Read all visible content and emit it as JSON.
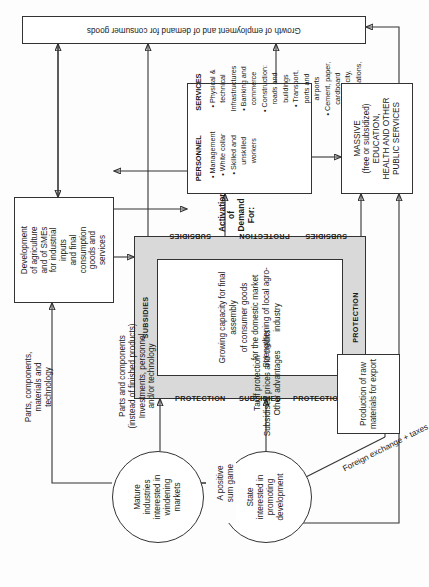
{
  "diagram": {
    "orientation": "page rotated 90 degrees counter-clockwise",
    "accent_shade": "#d9d9d9",
    "line_color": "#333333",
    "background": "#fdfdfd"
  },
  "nodes": {
    "mature_industries": "Mature\nindustries\ninterested in\nwindening\nmarkets",
    "state": "State\ninterested in\npromoting\ndevelopment",
    "development_agriculture": "Development\nof agriculture\nand of SMEs\nfor industrial\ninputs\nand final\nconsumption\ngoods and\nservices",
    "growing_capacity": "Growing capacity for final assembly\nof consumer goods\nfor the domestic market\nStrengthening of local agro-industry",
    "raw_materials": "Production of raw\nmaterials for export",
    "massive_education": "MASSIVE\n(free or subsidized)\nEDUCATION,\nHEALTH AND OTHER\nPUBLIC SERVICES",
    "growth_employment": "Growth of employment and of demand for consumer goods"
  },
  "demand_box": {
    "heading": "Activation of Demand For:",
    "personnel_header": "PERSONNEL",
    "personnel_items": [
      "Management",
      "White collar",
      "Skilled and",
      "unskilled workers"
    ],
    "services_header": "SERVICES",
    "services_items": [
      "Physical & technical Infrastructures",
      "Banking and commerce",
      "Construction: roads and buildings",
      "Transport, ports and airports",
      "Cement, paper, cardboard",
      "Electricity, communications, etc."
    ]
  },
  "ring": {
    "word_protection": "PROTECTION",
    "word_subsidies": "SUBSIDIES",
    "top_label": "SUBSIDIES",
    "bottom_label": "PROTECTION"
  },
  "edge_labels": {
    "parts_components_tech": "Parts, components,\nmaterials and\ntechnology",
    "parts_instead_finished": "Parts and components\n(instead of finished products)\nInvestments, personnel\nand/or technology",
    "positive_sum_game": "A positive\nsum game",
    "tariff_protection": "Tariff protection\nSubsidised prices and credits\nOther advantages",
    "foreign_exchange_taxes": "Foreign exchange + taxes"
  }
}
